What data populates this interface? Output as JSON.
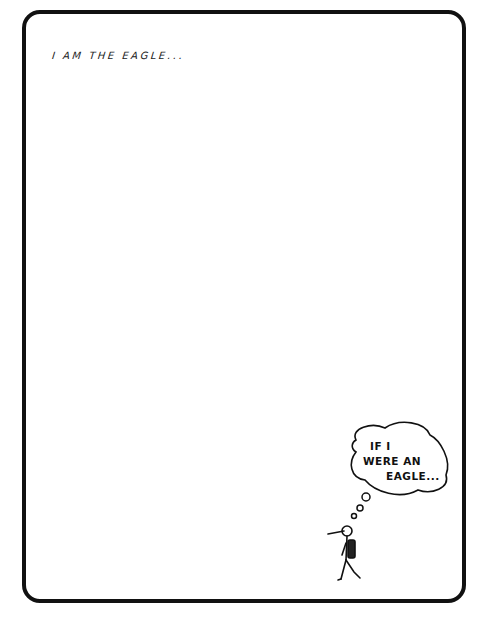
{
  "panel": {
    "caption": "I AM THE EAGLE...",
    "thought_bubble": {
      "lines": [
        "IF I",
        "WERE AN",
        "EAGLE..."
      ]
    },
    "figure": "stick-figure-with-backpack",
    "colors": {
      "ink": "#111111",
      "background": "#ffffff"
    }
  }
}
